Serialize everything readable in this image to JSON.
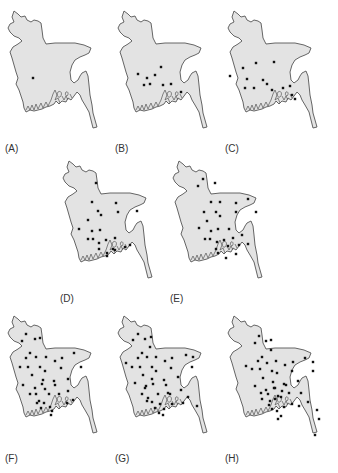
{
  "figure": {
    "colors": {
      "land": "#e3e3e3",
      "outline": "#555555",
      "dot": "#111111"
    },
    "panels": [
      {
        "id": "A",
        "label": "(A)",
        "left": 0,
        "top": 0,
        "dots": [
          [
            33,
            78
          ]
        ]
      },
      {
        "id": "B",
        "label": "(B)",
        "left": 110,
        "top": 0,
        "dots": [
          [
            28,
            74
          ],
          [
            37,
            78
          ],
          [
            51,
            67
          ],
          [
            45,
            75
          ],
          [
            34,
            85
          ],
          [
            40,
            84
          ],
          [
            53,
            85
          ],
          [
            61,
            84
          ],
          [
            71,
            92
          ]
        ]
      },
      {
        "id": "C",
        "label": "(C)",
        "left": 220,
        "top": 0,
        "dots": [
          [
            23,
            68
          ],
          [
            36,
            63
          ],
          [
            54,
            62
          ],
          [
            10,
            76
          ],
          [
            27,
            79
          ],
          [
            34,
            88
          ],
          [
            43,
            80
          ],
          [
            47,
            84
          ],
          [
            25,
            88
          ],
          [
            52,
            90
          ],
          [
            63,
            88
          ],
          [
            70,
            86
          ],
          [
            72,
            95
          ],
          [
            75,
            99
          ]
        ]
      },
      {
        "id": "D",
        "label": "(D)",
        "left": 55,
        "top": 150,
        "dots": [
          [
            41,
            33
          ],
          [
            37,
            52
          ],
          [
            43,
            61
          ],
          [
            46,
            65
          ],
          [
            61,
            53
          ],
          [
            63,
            62
          ],
          [
            82,
            61
          ],
          [
            33,
            70
          ],
          [
            24,
            79
          ],
          [
            37,
            81
          ],
          [
            45,
            80
          ],
          [
            33,
            89
          ],
          [
            38,
            89
          ],
          [
            44,
            93
          ],
          [
            51,
            90
          ],
          [
            60,
            88
          ],
          [
            70,
            97
          ],
          [
            44,
            99
          ],
          [
            52,
            103
          ],
          [
            60,
            100
          ],
          [
            75,
            95
          ],
          [
            52,
            106
          ],
          [
            58,
            99
          ]
        ]
      },
      {
        "id": "E",
        "label": "(E)",
        "left": 165,
        "top": 150,
        "dots": [
          [
            38,
            29
          ],
          [
            33,
            36
          ],
          [
            50,
            33
          ],
          [
            46,
            52
          ],
          [
            55,
            52
          ],
          [
            71,
            53
          ],
          [
            83,
            49
          ],
          [
            39,
            62
          ],
          [
            51,
            62
          ],
          [
            71,
            62
          ],
          [
            91,
            62
          ],
          [
            42,
            71
          ],
          [
            55,
            66
          ],
          [
            34,
            78
          ],
          [
            46,
            81
          ],
          [
            53,
            79
          ],
          [
            64,
            79
          ],
          [
            45,
            89
          ],
          [
            40,
            89
          ],
          [
            52,
            92
          ],
          [
            59,
            90
          ],
          [
            68,
            88
          ],
          [
            77,
            85
          ],
          [
            51,
            99
          ],
          [
            53,
            103
          ],
          [
            63,
            96
          ],
          [
            74,
            95
          ],
          [
            83,
            94
          ],
          [
            71,
            104
          ],
          [
            61,
            108
          ]
        ]
      },
      {
        "id": "F",
        "label": "(F)",
        "left": 0,
        "top": 305,
        "dots": [
          [
            26,
            29
          ],
          [
            22,
            36
          ],
          [
            35,
            34
          ],
          [
            40,
            33
          ],
          [
            30,
            48
          ],
          [
            26,
            53
          ],
          [
            36,
            52
          ],
          [
            46,
            52
          ],
          [
            55,
            56
          ],
          [
            62,
            53
          ],
          [
            74,
            48
          ],
          [
            20,
            62
          ],
          [
            28,
            62
          ],
          [
            40,
            62
          ],
          [
            45,
            66
          ],
          [
            61,
            63
          ],
          [
            81,
            62
          ],
          [
            32,
            70
          ],
          [
            43,
            75
          ],
          [
            42,
            79
          ],
          [
            54,
            76
          ],
          [
            55,
            80
          ],
          [
            68,
            74
          ],
          [
            23,
            80
          ],
          [
            35,
            83
          ],
          [
            45,
            84
          ],
          [
            30,
            89
          ],
          [
            36,
            89
          ],
          [
            49,
            89
          ],
          [
            59,
            89
          ],
          [
            68,
            86
          ],
          [
            39,
            96
          ],
          [
            44,
            98
          ],
          [
            50,
            102
          ],
          [
            37,
            98
          ],
          [
            41,
            103
          ],
          [
            52,
            106
          ],
          [
            51,
            110
          ],
          [
            67,
            98
          ],
          [
            73,
            95
          ]
        ]
      },
      {
        "id": "G",
        "label": "(G)",
        "left": 110,
        "top": 305,
        "dots": [
          [
            28,
            29
          ],
          [
            23,
            35
          ],
          [
            35,
            34
          ],
          [
            41,
            32
          ],
          [
            40,
            42
          ],
          [
            32,
            48
          ],
          [
            28,
            53
          ],
          [
            37,
            52
          ],
          [
            46,
            52
          ],
          [
            55,
            56
          ],
          [
            62,
            53
          ],
          [
            76,
            50
          ],
          [
            83,
            52
          ],
          [
            16,
            58
          ],
          [
            22,
            62
          ],
          [
            30,
            62
          ],
          [
            42,
            62
          ],
          [
            46,
            66
          ],
          [
            61,
            63
          ],
          [
            82,
            62
          ],
          [
            33,
            70
          ],
          [
            42,
            74
          ],
          [
            54,
            75
          ],
          [
            68,
            72
          ],
          [
            25,
            78
          ],
          [
            36,
            81
          ],
          [
            43,
            79
          ],
          [
            56,
            80
          ],
          [
            58,
            88
          ],
          [
            35,
            83
          ],
          [
            48,
            89
          ],
          [
            60,
            89
          ],
          [
            71,
            85
          ],
          [
            32,
            89
          ],
          [
            38,
            93
          ],
          [
            42,
            97
          ],
          [
            37,
            96
          ],
          [
            50,
            99
          ],
          [
            54,
            104
          ],
          [
            62,
            99
          ],
          [
            73,
            98
          ],
          [
            78,
            92
          ],
          [
            87,
            101
          ],
          [
            45,
            103
          ],
          [
            49,
            108
          ],
          [
            53,
            110
          ]
        ]
      },
      {
        "id": "H",
        "label": "(H)",
        "left": 220,
        "top": 305,
        "dots": [
          [
            39,
            31
          ],
          [
            35,
            38
          ],
          [
            46,
            36
          ],
          [
            51,
            35
          ],
          [
            51,
            45
          ],
          [
            42,
            52
          ],
          [
            38,
            56
          ],
          [
            47,
            58
          ],
          [
            56,
            56
          ],
          [
            65,
            60
          ],
          [
            73,
            57
          ],
          [
            85,
            53
          ],
          [
            93,
            57
          ],
          [
            26,
            61
          ],
          [
            32,
            64
          ],
          [
            40,
            64
          ],
          [
            52,
            66
          ],
          [
            57,
            68
          ],
          [
            72,
            66
          ],
          [
            93,
            66
          ],
          [
            43,
            73
          ],
          [
            53,
            77
          ],
          [
            54,
            83
          ],
          [
            64,
            79
          ],
          [
            78,
            76
          ],
          [
            35,
            81
          ],
          [
            46,
            85
          ],
          [
            55,
            83
          ],
          [
            66,
            80
          ],
          [
            69,
            88
          ],
          [
            41,
            88
          ],
          [
            48,
            89
          ],
          [
            58,
            91
          ],
          [
            62,
            86
          ],
          [
            81,
            88
          ],
          [
            42,
            94
          ],
          [
            50,
            96
          ],
          [
            55,
            94
          ],
          [
            61,
            92
          ],
          [
            49,
            100
          ],
          [
            52,
            104
          ],
          [
            57,
            106
          ],
          [
            64,
            102
          ],
          [
            72,
            99
          ],
          [
            79,
            101
          ],
          [
            88,
            97
          ],
          [
            97,
            105
          ],
          [
            99,
            114
          ],
          [
            58,
            114
          ],
          [
            61,
            111
          ],
          [
            95,
            130
          ]
        ]
      }
    ]
  }
}
